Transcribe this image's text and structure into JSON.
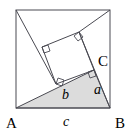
{
  "figure": {
    "kind": "geometry-diagram",
    "colors": {
      "background": "#ffffff",
      "stroke": "#4a4a52",
      "triangle_fill": "#dcdcdc",
      "label_color": "#000000",
      "right_angle_stroke": "#4a4a52"
    },
    "outer_square": {
      "name": "outer-square",
      "corners": {
        "top_left": [
          16,
          10
        ],
        "top_right": [
          110,
          10
        ],
        "bottom_right": [
          110,
          108
        ],
        "bottom_left": [
          16,
          108
        ]
      }
    },
    "triangle": {
      "name": "shaded-right-triangle",
      "vertices": {
        "A": [
          16,
          108
        ],
        "B": [
          110,
          108
        ],
        "C": [
          94,
          70
        ]
      },
      "right_angle_at": "C",
      "fill": "#dcdcdc"
    },
    "inner_square": {
      "name": "tilted-square-on-side-b",
      "corners": [
        [
          56,
          84
        ],
        [
          94,
          70
        ],
        [
          79,
          32
        ],
        [
          42,
          47
        ]
      ]
    },
    "construction_lines": [
      {
        "name": "line-top-left-to-inner-corner",
        "from": [
          16,
          10
        ],
        "to": [
          56,
          84
        ]
      },
      {
        "name": "line-inner-top-corner-to-top-right",
        "from": [
          79,
          32
        ],
        "to": [
          110,
          10
        ]
      },
      {
        "name": "line-diagonal-through-C-to-B",
        "from": [
          79,
          32
        ],
        "to": [
          110,
          108
        ]
      }
    ],
    "right_angle_markers": [
      {
        "name": "right-angle-marker-inner-left",
        "at": [
          42,
          47
        ]
      },
      {
        "name": "right-angle-marker-inner-top",
        "at": [
          79,
          32
        ]
      },
      {
        "name": "right-angle-marker-inner-bottom",
        "at": [
          56,
          84
        ]
      },
      {
        "name": "right-angle-marker-vertex-c",
        "at": [
          94,
          70
        ]
      }
    ],
    "vertex_labels": [
      {
        "name": "vertex-label-a",
        "text": "A",
        "x": 6,
        "y": 128
      },
      {
        "name": "vertex-label-b",
        "text": "B",
        "x": 115,
        "y": 128
      },
      {
        "name": "vertex-label-c",
        "text": "C",
        "x": 98,
        "y": 66
      }
    ],
    "side_labels": [
      {
        "name": "side-label-a",
        "text": "a",
        "x": 94,
        "y": 94
      },
      {
        "name": "side-label-b",
        "text": "b",
        "x": 62,
        "y": 99
      },
      {
        "name": "side-label-c",
        "text": "c",
        "x": 63,
        "y": 126
      }
    ]
  }
}
